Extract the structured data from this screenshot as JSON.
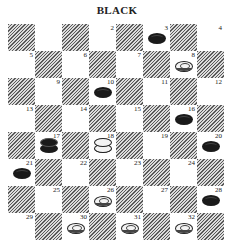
{
  "title": "BLACK",
  "board": {
    "size": 8,
    "squares": [
      {
        "n": 1,
        "row": 0,
        "col": 1,
        "label": "",
        "piece": null
      },
      {
        "n": 2,
        "row": 0,
        "col": 3,
        "label": "2",
        "piece": null
      },
      {
        "n": 3,
        "row": 0,
        "col": 5,
        "label": "3",
        "piece": "black-man"
      },
      {
        "n": 4,
        "row": 0,
        "col": 7,
        "label": "4",
        "piece": null
      },
      {
        "n": 5,
        "row": 1,
        "col": 0,
        "label": "5",
        "piece": null
      },
      {
        "n": 6,
        "row": 1,
        "col": 2,
        "label": "6",
        "piece": null
      },
      {
        "n": 7,
        "row": 1,
        "col": 4,
        "label": "7",
        "piece": null
      },
      {
        "n": 8,
        "row": 1,
        "col": 6,
        "label": "8",
        "piece": "white-man"
      },
      {
        "n": 9,
        "row": 2,
        "col": 1,
        "label": "9",
        "piece": null
      },
      {
        "n": 10,
        "row": 2,
        "col": 3,
        "label": "10",
        "piece": "black-man"
      },
      {
        "n": 11,
        "row": 2,
        "col": 5,
        "label": "11",
        "piece": null
      },
      {
        "n": 12,
        "row": 2,
        "col": 7,
        "label": "12",
        "piece": null
      },
      {
        "n": 13,
        "row": 3,
        "col": 0,
        "label": "13",
        "piece": null
      },
      {
        "n": 14,
        "row": 3,
        "col": 2,
        "label": "14",
        "piece": null
      },
      {
        "n": 15,
        "row": 3,
        "col": 4,
        "label": "15",
        "piece": null
      },
      {
        "n": 16,
        "row": 3,
        "col": 6,
        "label": "16",
        "piece": "black-man"
      },
      {
        "n": 17,
        "row": 4,
        "col": 1,
        "label": "17",
        "piece": "black-king"
      },
      {
        "n": 18,
        "row": 4,
        "col": 3,
        "label": "18",
        "piece": "white-king"
      },
      {
        "n": 19,
        "row": 4,
        "col": 5,
        "label": "19",
        "piece": null
      },
      {
        "n": 20,
        "row": 4,
        "col": 7,
        "label": "20",
        "piece": "black-man"
      },
      {
        "n": 21,
        "row": 5,
        "col": 0,
        "label": "21",
        "piece": "black-man"
      },
      {
        "n": 22,
        "row": 5,
        "col": 2,
        "label": "22",
        "piece": null
      },
      {
        "n": 23,
        "row": 5,
        "col": 4,
        "label": "23",
        "piece": null
      },
      {
        "n": 24,
        "row": 5,
        "col": 6,
        "label": "24",
        "piece": null
      },
      {
        "n": 25,
        "row": 6,
        "col": 1,
        "label": "25",
        "piece": null
      },
      {
        "n": 26,
        "row": 6,
        "col": 3,
        "label": "26",
        "piece": "white-man"
      },
      {
        "n": 27,
        "row": 6,
        "col": 5,
        "label": "27",
        "piece": null
      },
      {
        "n": 28,
        "row": 6,
        "col": 7,
        "label": "28",
        "piece": "black-man"
      },
      {
        "n": 29,
        "row": 7,
        "col": 0,
        "label": "29",
        "piece": null
      },
      {
        "n": 30,
        "row": 7,
        "col": 2,
        "label": "30",
        "piece": "white-man"
      },
      {
        "n": 31,
        "row": 7,
        "col": 4,
        "label": "31",
        "piece": "white-man"
      },
      {
        "n": 32,
        "row": 7,
        "col": 6,
        "label": "32",
        "piece": "white-man"
      }
    ]
  },
  "colors": {
    "hatch_dark": "#5a5a5a",
    "hatch_light": "#dcdcdc",
    "light_square": "#ffffff",
    "black_piece": "#1a1a1a",
    "white_piece": "#f4f4f4"
  }
}
